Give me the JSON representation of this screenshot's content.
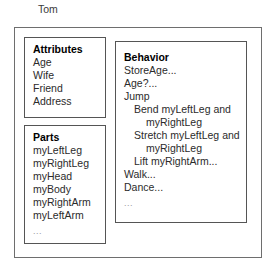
{
  "diagram": {
    "object_name": "Tom",
    "compartments": {
      "attributes": {
        "title": "Attributes",
        "items": [
          {
            "text": "Age",
            "indent": 0
          },
          {
            "text": "Wife",
            "indent": 0
          },
          {
            "text": "Friend",
            "indent": 0
          },
          {
            "text": "Address",
            "indent": 0
          }
        ],
        "more": "..."
      },
      "parts": {
        "title": "Parts",
        "items": [
          {
            "text": "myLeftLeg",
            "indent": 0
          },
          {
            "text": "myRightLeg",
            "indent": 0
          },
          {
            "text": "myHead",
            "indent": 0
          },
          {
            "text": "myBody",
            "indent": 0
          },
          {
            "text": "myRightArm",
            "indent": 0
          },
          {
            "text": "myLeftArm",
            "indent": 0
          }
        ],
        "more": "..."
      },
      "behavior": {
        "title": "Behavior",
        "items": [
          {
            "text": "StoreAge...",
            "indent": 0
          },
          {
            "text": "Age?...",
            "indent": 0
          },
          {
            "text": "Jump",
            "indent": 0
          },
          {
            "text": "Bend myLeftLeg and",
            "indent": 1
          },
          {
            "text": "myRightLeg",
            "indent": 2
          },
          {
            "text": "Stretch myLeftLeg and",
            "indent": 1
          },
          {
            "text": "myRightLeg",
            "indent": 2
          },
          {
            "text": "Lift myRightArm...",
            "indent": 1
          },
          {
            "text": "Walk...",
            "indent": 0
          },
          {
            "text": "Dance...",
            "indent": 0
          }
        ],
        "more": "..."
      }
    },
    "colors": {
      "outer_border": "#6e6e6e",
      "inner_border": "#555555",
      "text": "#2b2b2b",
      "title_text": "#000000",
      "ellipsis_text": "#9a9a9a",
      "background": "#ffffff"
    }
  }
}
